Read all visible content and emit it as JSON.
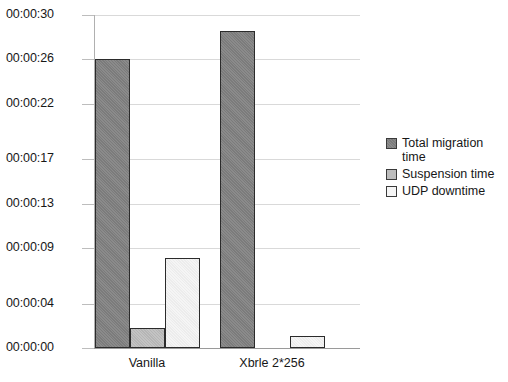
{
  "chart_data": {
    "type": "bar",
    "title": "",
    "xlabel": "",
    "ylabel": "",
    "categories": [
      "Vanilla",
      "Xbrle 2*256"
    ],
    "ytick_labels": [
      "00:00:30",
      "00:00:26",
      "00:00:22",
      "00:00:17",
      "00:00:13",
      "00:00:09",
      "00:00:04",
      "00:00:00"
    ],
    "ytick_values": [
      30,
      26,
      22,
      17,
      13,
      9,
      4,
      0
    ],
    "ylim": [
      0,
      30
    ],
    "grid": true,
    "legend_position": "right",
    "series": [
      {
        "name": "Total migration time",
        "color": "#828282",
        "values": [
          26.0,
          28.6
        ]
      },
      {
        "name": "Suspension time",
        "color": "#bcbcbc",
        "values": [
          1.8,
          0
        ]
      },
      {
        "name": "UDP downtime",
        "color": "#f1f1f1",
        "values": [
          8.1,
          1.1
        ]
      }
    ]
  },
  "legend": {
    "items": [
      {
        "label": "Total migration time",
        "swatch": "total"
      },
      {
        "label": "Suspension time",
        "swatch": "suspension"
      },
      {
        "label": "UDP downtime",
        "swatch": "udp"
      }
    ]
  },
  "axes": {
    "y_labels": [
      "00:00:30",
      "00:00:26",
      "00:00:22",
      "00:00:17",
      "00:00:13",
      "00:00:09",
      "00:00:04",
      "00:00:00"
    ],
    "x_labels": [
      "Vanilla",
      "Xbrle 2*256"
    ]
  },
  "colors": {
    "total": "#828282",
    "suspension": "#bcbcbc",
    "udp": "#f1f1f1",
    "gridline": "#d9d9d9",
    "axis": "#9a9a9a",
    "bar_outline": "#2b2b2b",
    "background": "#ffffff",
    "text": "#171717"
  }
}
